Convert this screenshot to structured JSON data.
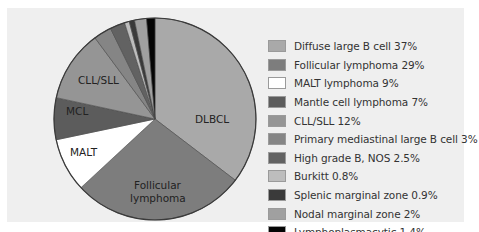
{
  "chart_data": {
    "type": "pie",
    "title": "",
    "start_angle_deg": 0,
    "direction": "clockwise",
    "slices": [
      {
        "name": "Diffuse large B cell",
        "short": "DLBCL",
        "value": 37,
        "color": "#a9a9a9",
        "legend": "Diffuse large B cell 37%"
      },
      {
        "name": "Follicular lymphoma",
        "short": "Follicular lymphoma",
        "value": 29,
        "color": "#7d7d7d",
        "legend": "Follicular lymphoma 29%"
      },
      {
        "name": "MALT lymphoma",
        "short": "MALT",
        "value": 9,
        "color": "#ffffff",
        "legend": "MALT lymphoma 9%"
      },
      {
        "name": "Mantle cell lymphoma",
        "short": "MCL",
        "value": 7,
        "color": "#5c5c5c",
        "legend": "Mantle cell lymphoma 7%"
      },
      {
        "name": "CLL/SLL",
        "short": "CLL/SLL",
        "value": 12,
        "color": "#959595",
        "legend": "CLL/SLL 12%"
      },
      {
        "name": "Primary mediastinal large B cell",
        "short": "",
        "value": 3,
        "color": "#858585",
        "legend": "Primary mediastinal large B cell 3%"
      },
      {
        "name": "High grade B, NOS",
        "short": "",
        "value": 2.5,
        "color": "#626262",
        "legend": "High grade B, NOS 2.5%"
      },
      {
        "name": "Burkitt",
        "short": "",
        "value": 0.8,
        "color": "#bdbdbd",
        "legend": "Burkitt 0.8%"
      },
      {
        "name": "Splenic marginal zone",
        "short": "",
        "value": 0.9,
        "color": "#3a3a3a",
        "legend": "Splenic marginal zone 0.9%"
      },
      {
        "name": "Nodal marginal zone",
        "short": "",
        "value": 2,
        "color": "#a0a0a0",
        "legend": "Nodal marginal zone 2%"
      },
      {
        "name": "Lymphoplasmacytic",
        "short": "",
        "value": 1.4,
        "color": "#050505",
        "legend": "Lymphoplasmacytic 1.4%"
      }
    ],
    "legend_position": "right",
    "in_slice_labels": [
      "DLBCL",
      "Follicular lymphoma",
      "MALT",
      "MCL",
      "CLL/SLL"
    ]
  },
  "legend": {
    "items": [
      {
        "label": "Diffuse large B cell 37%",
        "color": "#a9a9a9"
      },
      {
        "label": "Follicular lymphoma 29%",
        "color": "#7d7d7d"
      },
      {
        "label": "MALT lymphoma 9%",
        "color": "#ffffff"
      },
      {
        "label": "Mantle cell lymphoma 7%",
        "color": "#5c5c5c"
      },
      {
        "label": "CLL/SLL 12%",
        "color": "#959595"
      },
      {
        "label": "Primary mediastinal large B cell 3%",
        "color": "#858585"
      },
      {
        "label": "High grade B, NOS 2.5%",
        "color": "#626262"
      },
      {
        "label": "Burkitt 0.8%",
        "color": "#bdbdbd"
      },
      {
        "label": "Splenic marginal zone 0.9%",
        "color": "#3a3a3a"
      },
      {
        "label": "Nodal marginal zone 2%",
        "color": "#a0a0a0"
      },
      {
        "label": "Lymphoplasmacytic 1.4%",
        "color": "#050505"
      }
    ]
  },
  "labels": {
    "dlbcl": "DLBCL",
    "follicular_1": "Follicular",
    "follicular_2": "lymphoma",
    "malt": "MALT",
    "mcl": "MCL",
    "cll": "CLL/SLL"
  }
}
